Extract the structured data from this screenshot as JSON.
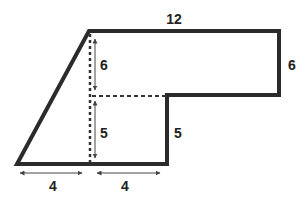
{
  "diagram": {
    "type": "composite-shape",
    "colors": {
      "outline": "#2b2b2b",
      "dashed": "#333333",
      "arrow": "#444444",
      "text": "#222222",
      "background": "#ffffff"
    },
    "labels": {
      "top_width": "12",
      "right_height": "6",
      "inner_upper_height": "6",
      "inner_lower_height": "5",
      "step_height": "5",
      "bottom_left_width": "4",
      "bottom_right_width": "4"
    }
  }
}
